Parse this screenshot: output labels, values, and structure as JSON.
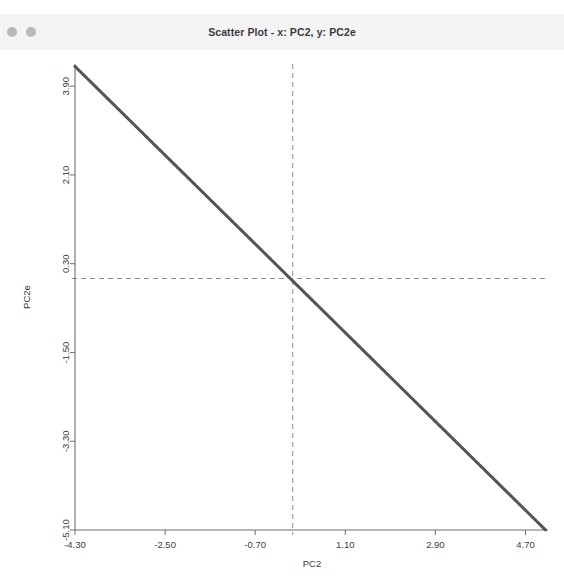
{
  "window": {
    "title": "Scatter Plot - x: PC2, y: PC2e",
    "controls": [
      {
        "name": "window-dot-one"
      },
      {
        "name": "window-dot-two"
      }
    ]
  },
  "colors": {
    "titlebar_bg": "#f4f4f5",
    "titlebar_text": "#3a3a40",
    "window_dot": "#b9b9bb",
    "plot_bg": "#ffffff",
    "axis_line": "#6e6e76",
    "tick_text": "#3c3c42",
    "point": "#55555d",
    "crosshair": "#8a8a98"
  },
  "chart_data": {
    "type": "scatter",
    "title": "Scatter Plot - x: PC2, y: PC2e",
    "xlabel": "PC2",
    "ylabel": "PC2e",
    "xlim": [
      -4.3,
      5.15
    ],
    "ylim": [
      -5.1,
      4.35
    ],
    "xticks": [
      -4.3,
      -2.5,
      -0.7,
      1.1,
      2.9,
      4.7
    ],
    "xtick_labels": [
      "-4.30",
      "-2.50",
      "-0.70",
      "1.10",
      "2.90",
      "4.70"
    ],
    "yticks": [
      -5.1,
      -3.3,
      -1.5,
      0.3,
      2.1,
      3.9
    ],
    "ytick_labels": [
      "-5.10",
      "-3.30",
      "-1.50",
      "0.30",
      "2.10",
      "3.90"
    ],
    "grid": false,
    "legend": false,
    "annotations": {
      "crosshair_vertical_x": 0.05,
      "crosshair_horizontal_y": 0.0,
      "crosshair_style": "dashed"
    },
    "series": [
      {
        "name": "PC2 vs PC2e",
        "relation": "y = -x",
        "x": [
          -4.3,
          -4.15,
          -4.0,
          -3.85,
          -3.7,
          -3.55,
          -3.4,
          -3.25,
          -3.1,
          -2.95,
          -2.8,
          -2.65,
          -2.5,
          -2.35,
          -2.2,
          -2.05,
          -1.9,
          -1.75,
          -1.6,
          -1.45,
          -1.3,
          -1.15,
          -1.0,
          -0.85,
          -0.7,
          -0.55,
          -0.4,
          -0.25,
          -0.1,
          0.05,
          0.2,
          0.35,
          0.5,
          0.65,
          0.8,
          0.95,
          1.1,
          1.25,
          1.4,
          1.55,
          1.7,
          1.85,
          2.0,
          2.15,
          2.3,
          2.45,
          2.6,
          2.75,
          2.9,
          3.05,
          3.2,
          3.35,
          3.5,
          3.65,
          3.8,
          3.95,
          4.1,
          4.25,
          4.4,
          4.55,
          4.7,
          4.85,
          5.0,
          5.1
        ],
        "y": [
          4.3,
          4.15,
          4.0,
          3.85,
          3.7,
          3.55,
          3.4,
          3.25,
          3.1,
          2.95,
          2.8,
          2.65,
          2.5,
          2.35,
          2.2,
          2.05,
          1.9,
          1.75,
          1.6,
          1.45,
          1.3,
          1.15,
          1.0,
          0.85,
          0.7,
          0.55,
          0.4,
          0.25,
          0.1,
          -0.05,
          -0.2,
          -0.35,
          -0.5,
          -0.65,
          -0.8,
          -0.95,
          -1.1,
          -1.25,
          -1.4,
          -1.55,
          -1.7,
          -1.85,
          -2.0,
          -2.15,
          -2.3,
          -2.45,
          -2.6,
          -2.75,
          -2.9,
          -3.05,
          -3.2,
          -3.35,
          -3.5,
          -3.65,
          -3.8,
          -3.95,
          -4.1,
          -4.25,
          -4.4,
          -4.55,
          -4.7,
          -4.85,
          -5.0,
          -5.1
        ]
      }
    ]
  }
}
